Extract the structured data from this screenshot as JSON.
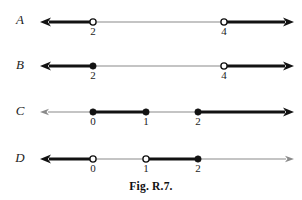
{
  "figure": {
    "caption": "Fig. R.7.",
    "caption_top": 180,
    "width": 302,
    "height": 200,
    "axis_color": "#8a8a8a",
    "highlight_color": "#121212",
    "text_color": "#1c1c1c"
  },
  "rows": [
    {
      "id": "A",
      "label": "A",
      "label_x": 20,
      "label_y": 12,
      "axis_y": 22,
      "axis_left": 40,
      "axis_right": 294,
      "ticks": [
        {
          "value": "2",
          "x": 93,
          "marker": "open"
        },
        {
          "value": "4",
          "x": 224,
          "marker": "open"
        }
      ],
      "segments": [
        {
          "from": 40,
          "to": 93,
          "weight": "thick",
          "arrow": "left"
        },
        {
          "from": 93,
          "to": 224,
          "weight": "thin",
          "arrow": "none"
        },
        {
          "from": 224,
          "to": 294,
          "weight": "thick",
          "arrow": "right"
        }
      ]
    },
    {
      "id": "B",
      "label": "B",
      "label_x": 20,
      "label_y": 57,
      "axis_y": 66,
      "axis_left": 40,
      "axis_right": 294,
      "ticks": [
        {
          "value": "2",
          "x": 93,
          "marker": "closed"
        },
        {
          "value": "4",
          "x": 224,
          "marker": "open"
        }
      ],
      "segments": [
        {
          "from": 40,
          "to": 93,
          "weight": "thick",
          "arrow": "left"
        },
        {
          "from": 93,
          "to": 224,
          "weight": "thin",
          "arrow": "none"
        },
        {
          "from": 224,
          "to": 294,
          "weight": "thick",
          "arrow": "right"
        }
      ]
    },
    {
      "id": "C",
      "label": "C",
      "label_x": 20,
      "label_y": 103,
      "axis_y": 112,
      "axis_left": 40,
      "axis_right": 294,
      "ticks": [
        {
          "value": "0",
          "x": 93,
          "marker": "closed"
        },
        {
          "value": "1",
          "x": 146,
          "marker": "closed"
        },
        {
          "value": "2",
          "x": 198,
          "marker": "closed"
        }
      ],
      "segments": [
        {
          "from": 40,
          "to": 93,
          "weight": "thin",
          "arrow": "left"
        },
        {
          "from": 93,
          "to": 146,
          "weight": "thick",
          "arrow": "none"
        },
        {
          "from": 146,
          "to": 198,
          "weight": "thin",
          "arrow": "none"
        },
        {
          "from": 198,
          "to": 294,
          "weight": "thick",
          "arrow": "right"
        }
      ]
    },
    {
      "id": "D",
      "label": "D",
      "label_x": 20,
      "label_y": 150,
      "axis_y": 159,
      "axis_left": 40,
      "axis_right": 294,
      "ticks": [
        {
          "value": "0",
          "x": 93,
          "marker": "open"
        },
        {
          "value": "1",
          "x": 146,
          "marker": "open"
        },
        {
          "value": "2",
          "x": 198,
          "marker": "closed"
        }
      ],
      "segments": [
        {
          "from": 40,
          "to": 93,
          "weight": "thick",
          "arrow": "left"
        },
        {
          "from": 93,
          "to": 146,
          "weight": "thin",
          "arrow": "none"
        },
        {
          "from": 146,
          "to": 198,
          "weight": "thick",
          "arrow": "none"
        },
        {
          "from": 198,
          "to": 294,
          "weight": "thin",
          "arrow": "right"
        }
      ]
    }
  ],
  "chart_data": {
    "type": "line",
    "title": "Fig. R.7.",
    "xlabel": "",
    "ylabel": "",
    "series": [
      {
        "name": "A",
        "labeled_points": [
          2,
          4
        ],
        "markers": [
          "open",
          "open"
        ],
        "shaded_intervals": [
          {
            "from": "-infinity",
            "to": 2,
            "endpoint": "open"
          },
          {
            "from": 4,
            "to": "+infinity",
            "endpoint": "open"
          }
        ]
      },
      {
        "name": "B",
        "labeled_points": [
          2,
          4
        ],
        "markers": [
          "closed",
          "open"
        ],
        "shaded_intervals": [
          {
            "from": "-infinity",
            "to": 2,
            "endpoint": "closed"
          },
          {
            "from": 4,
            "to": "+infinity",
            "endpoint": "open"
          }
        ]
      },
      {
        "name": "C",
        "labeled_points": [
          0,
          1,
          2
        ],
        "markers": [
          "closed",
          "closed",
          "closed"
        ],
        "shaded_intervals": [
          {
            "from": 0,
            "to": 1,
            "endpoint": "closed"
          },
          {
            "from": 2,
            "to": "+infinity",
            "endpoint": "closed"
          }
        ]
      },
      {
        "name": "D",
        "labeled_points": [
          0,
          1,
          2
        ],
        "markers": [
          "open",
          "open",
          "closed"
        ],
        "shaded_intervals": [
          {
            "from": "-infinity",
            "to": 0,
            "endpoint": "open"
          },
          {
            "from": 1,
            "to": 2,
            "endpoint": "open-closed"
          }
        ]
      }
    ]
  }
}
